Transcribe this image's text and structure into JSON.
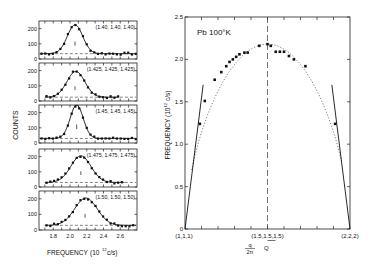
{
  "chart_data": [
    {
      "type": "scatter",
      "title": "Neutron scattering groups",
      "xlabel": "FREQUENCY (10^12 c/s)",
      "ylabel": "COUNTS",
      "xticks": [
        "1.8",
        "2.0",
        "2.2",
        "2.4",
        "2.6"
      ],
      "xlim": [
        1.63,
        2.8
      ],
      "yticks": [
        "0",
        "100",
        "200"
      ],
      "ylim": [
        0,
        250
      ],
      "panels": [
        {
          "label": "(1.40, 1.40, 1.40)",
          "peak": 2.06,
          "height": 190,
          "width": 0.13,
          "baseline": 35,
          "marker": 2.06
        },
        {
          "label": "(1.425, 1.425, 1.425)",
          "peak": 2.07,
          "height": 170,
          "width": 0.15,
          "baseline": 25,
          "marker": 2.06
        },
        {
          "label": "(1.45, 1.45, 1.45)",
          "peak": 2.08,
          "height": 220,
          "width": 0.11,
          "baseline": 30,
          "marker": 2.08
        },
        {
          "label": "(1.475, 1.475, 1.475)",
          "peak": 2.13,
          "height": 175,
          "width": 0.17,
          "baseline": 30,
          "marker": 2.13
        },
        {
          "label": "(1.50, 1.50, 1.50)",
          "peak": 2.19,
          "height": 175,
          "width": 0.19,
          "baseline": 30,
          "marker": 2.18
        }
      ]
    },
    {
      "type": "scatter",
      "title": "Pb 100°K",
      "xlabel": "q/2π Q",
      "ylabel": "FREQUENCY (10^12 c/s)",
      "xtick_labels": [
        "(1,1,1)",
        "(1.5,1.5,1.5)",
        "(2,2,2)"
      ],
      "yticks": [
        "0",
        "0.5",
        "1.0",
        "1.5",
        "2.0",
        "2.5"
      ],
      "ylim": [
        0,
        2.5
      ],
      "xlim": [
        1.0,
        2.0
      ],
      "points": [
        {
          "x": 1.09,
          "y": 1.24
        },
        {
          "x": 1.12,
          "y": 1.51
        },
        {
          "x": 1.18,
          "y": 1.76
        },
        {
          "x": 1.22,
          "y": 1.85
        },
        {
          "x": 1.25,
          "y": 1.92
        },
        {
          "x": 1.27,
          "y": 1.97
        },
        {
          "x": 1.29,
          "y": 2.0
        },
        {
          "x": 1.31,
          "y": 2.03
        },
        {
          "x": 1.33,
          "y": 2.06
        },
        {
          "x": 1.36,
          "y": 2.08
        },
        {
          "x": 1.38,
          "y": 2.08
        },
        {
          "x": 1.45,
          "y": 2.16
        },
        {
          "x": 1.5,
          "y": 2.18
        },
        {
          "x": 1.52,
          "y": 2.16
        },
        {
          "x": 1.55,
          "y": 2.09
        },
        {
          "x": 1.575,
          "y": 2.09
        },
        {
          "x": 1.6,
          "y": 2.09
        },
        {
          "x": 1.63,
          "y": 2.04
        },
        {
          "x": 1.66,
          "y": 2.0
        },
        {
          "x": 1.73,
          "y": 1.92
        },
        {
          "x": 1.91,
          "y": 1.24
        }
      ],
      "tangent_lines": [
        {
          "from": [
            1.0,
            0.0
          ],
          "to": [
            1.11,
            1.7
          ]
        },
        {
          "from": [
            2.0,
            0.0
          ],
          "to": [
            1.89,
            1.7
          ]
        }
      ],
      "vertical_dashed_line_x": 1.5
    }
  ],
  "left": {
    "ylabel": "COUNTS",
    "xlabel": "FREQUENCY",
    "xlabel_units_prefix": "(10",
    "xlabel_units_exp": "12",
    "xlabel_units_suffix": " c/s)",
    "yticks": [
      "200",
      "100",
      "0"
    ],
    "xticks": [
      "1.8",
      "2.0",
      "2.2",
      "2.4",
      "2.6"
    ],
    "panel_labels": [
      "(1.40, 1.40, 1.40)",
      "(1.425, 1.425, 1.425)",
      "(1.45, 1.45, 1.45)",
      "(1.475, 1.475, 1.475)",
      "(1.50, 1.50, 1.50)"
    ]
  },
  "right": {
    "title": "Pb  100°K",
    "ylabel_prefix": "FREQUENCY  (10",
    "ylabel_exp": "12",
    "ylabel_suffix": " c/s)",
    "yticks": [
      "2.5",
      "2.0",
      "1.5",
      "1.0",
      "0.5",
      "0"
    ],
    "xtick_left": "(1,1,1)",
    "xtick_mid": "(1.5,1.5,1.5)",
    "xtick_right": "(2,2,2)",
    "xlabel_num": "q",
    "xlabel_den": "2π",
    "xlabel_q": "Q"
  }
}
